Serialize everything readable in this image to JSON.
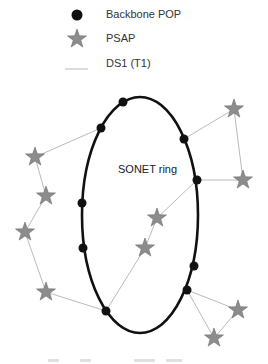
{
  "legend": {
    "items": [
      {
        "symbol": "filled-circle",
        "label": "Backbone POP"
      },
      {
        "symbol": "star",
        "label": "PSAP"
      },
      {
        "symbol": "thin-line",
        "label": "DS1 (T1)"
      }
    ]
  },
  "ring": {
    "label": "SONET ring"
  },
  "colors": {
    "pop": "#111111",
    "psap": "#8c8c8c",
    "psap_stroke": "#6e6e6e",
    "ds1_line": "#a8a8a8",
    "ring": "#111111"
  }
}
